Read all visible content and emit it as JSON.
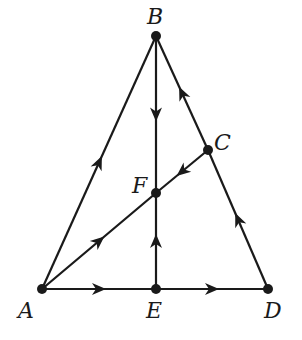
{
  "diagram": {
    "type": "directed-graph-triangle",
    "colors": {
      "stroke": "#1a1a1a",
      "background": "#ffffff"
    },
    "points": [
      {
        "id": "A",
        "label": "A",
        "x": 42,
        "y": 289,
        "label_x": 18,
        "label_y": 300
      },
      {
        "id": "B",
        "label": "B",
        "x": 156,
        "y": 36,
        "label_x": 147,
        "label_y": 6
      },
      {
        "id": "C",
        "label": "C",
        "x": 208,
        "y": 150,
        "label_x": 214,
        "label_y": 132
      },
      {
        "id": "D",
        "label": "D",
        "x": 268,
        "y": 289,
        "label_x": 264,
        "label_y": 300
      },
      {
        "id": "E",
        "label": "E",
        "x": 156,
        "y": 289,
        "label_x": 146,
        "label_y": 300
      },
      {
        "id": "F",
        "label": "F",
        "x": 156,
        "y": 193,
        "label_x": 132,
        "label_y": 175
      }
    ],
    "edges": [
      {
        "from": "A",
        "to": "B"
      },
      {
        "from": "B",
        "to": "F"
      },
      {
        "from": "D",
        "to": "C"
      },
      {
        "from": "C",
        "to": "B"
      },
      {
        "from": "C",
        "to": "F"
      },
      {
        "from": "A",
        "to": "F"
      },
      {
        "from": "E",
        "to": "F"
      },
      {
        "from": "A",
        "to": "E"
      },
      {
        "from": "E",
        "to": "D"
      }
    ]
  }
}
